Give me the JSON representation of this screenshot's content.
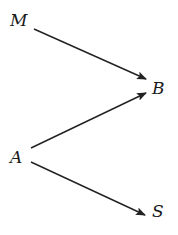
{
  "diagram": {
    "type": "directed-graph",
    "line_color": "#222222",
    "nodes": [
      {
        "id": "M",
        "label": "M",
        "x": 10,
        "y": 12
      },
      {
        "id": "B",
        "label": "B",
        "x": 152,
        "y": 80
      },
      {
        "id": "A",
        "label": "A",
        "x": 10,
        "y": 149
      },
      {
        "id": "S",
        "label": "S",
        "x": 152,
        "y": 203
      }
    ],
    "edges": [
      {
        "from": "M",
        "to": "B",
        "x1": 34,
        "y1": 29,
        "x2": 146,
        "y2": 79
      },
      {
        "from": "A",
        "to": "B",
        "x1": 31,
        "y1": 148,
        "x2": 146,
        "y2": 93
      },
      {
        "from": "A",
        "to": "S",
        "x1": 31,
        "y1": 162,
        "x2": 145,
        "y2": 215
      }
    ]
  }
}
